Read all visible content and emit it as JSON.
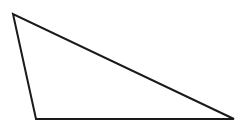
{
  "diagram": {
    "type": "triangle",
    "vertices": [
      {
        "name": "top-left",
        "x": 13,
        "y": 14
      },
      {
        "name": "bottom-left",
        "x": 36,
        "y": 119
      },
      {
        "name": "bottom-right",
        "x": 234,
        "y": 119
      }
    ],
    "stroke_color": "#1a1a1a",
    "fill_color": "#ffffff",
    "stroke_width": 2
  }
}
